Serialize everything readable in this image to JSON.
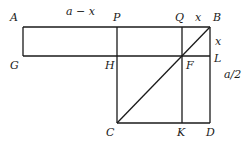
{
  "diagram": {
    "points": {
      "A": {
        "label": "A",
        "x": 23,
        "y": 27
      },
      "B": {
        "label": "B",
        "x": 210,
        "y": 27
      },
      "P": {
        "label": "P",
        "x": 117,
        "y": 27
      },
      "Q": {
        "label": "Q",
        "x": 182,
        "y": 27
      },
      "G": {
        "label": "G",
        "x": 23,
        "y": 56
      },
      "H": {
        "label": "H",
        "x": 117,
        "y": 56
      },
      "F": {
        "label": "F",
        "x": 182,
        "y": 56
      },
      "L": {
        "label": "L",
        "x": 210,
        "y": 56
      },
      "C": {
        "label": "C",
        "x": 117,
        "y": 123
      },
      "K": {
        "label": "K",
        "x": 182,
        "y": 123
      },
      "D": {
        "label": "D",
        "x": 210,
        "y": 123
      }
    },
    "measures": {
      "top_segment": "a − x",
      "qb": "x",
      "bl": "x",
      "ld": "a/2"
    }
  }
}
